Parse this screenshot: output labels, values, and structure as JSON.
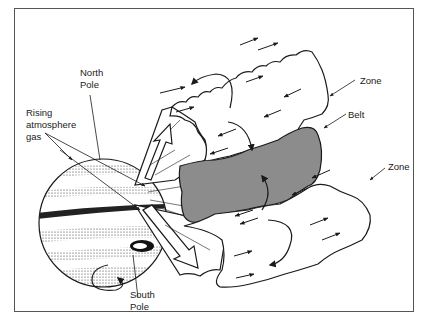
{
  "labels": {
    "north_pole": [
      "North",
      "Pole"
    ],
    "south_pole": [
      "South",
      "Pole"
    ],
    "rising_gas": [
      "Rising",
      "atmosphere",
      "gas"
    ],
    "zone_top": "Zone",
    "belt": "Belt",
    "zone_bottom": "Zone"
  },
  "colors": {
    "belt_fill": "#8c8c8c",
    "line": "#1a1a1a",
    "frame": "#555555",
    "background": "#ffffff"
  }
}
